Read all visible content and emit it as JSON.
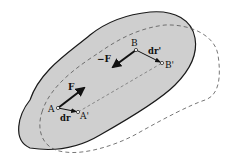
{
  "diagram": {
    "colors": {
      "body_fill": "#cfcfcf",
      "outline": "#1a1a1a",
      "dashed": "#555555",
      "background": "#ffffff"
    },
    "points": {
      "A": {
        "label": "A",
        "x": 58,
        "y": 108
      },
      "A_prime": {
        "label": "A'",
        "x": 78,
        "y": 112
      },
      "B": {
        "label": "B",
        "x": 136,
        "y": 50
      },
      "B_prime": {
        "label": "B'",
        "x": 162,
        "y": 63
      }
    },
    "vectors": {
      "F": {
        "label": "F"
      },
      "neg_F": {
        "label": "−F"
      },
      "dr": {
        "label": "dr"
      },
      "dr_prime": {
        "label": "dr'"
      }
    }
  }
}
